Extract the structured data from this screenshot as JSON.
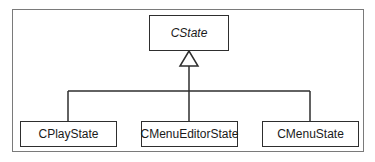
{
  "diagram": {
    "type": "uml-class-inheritance",
    "base_class": {
      "name": "CState",
      "abstract": true
    },
    "derived_classes": [
      {
        "name": "CPlayState"
      },
      {
        "name": "CMenuEditorState"
      },
      {
        "name": "CMenuState"
      }
    ],
    "relationship": "generalization",
    "colors": {
      "line": "#2e2e2e",
      "frame": "#7a7a7a",
      "background": "#ffffff"
    }
  }
}
